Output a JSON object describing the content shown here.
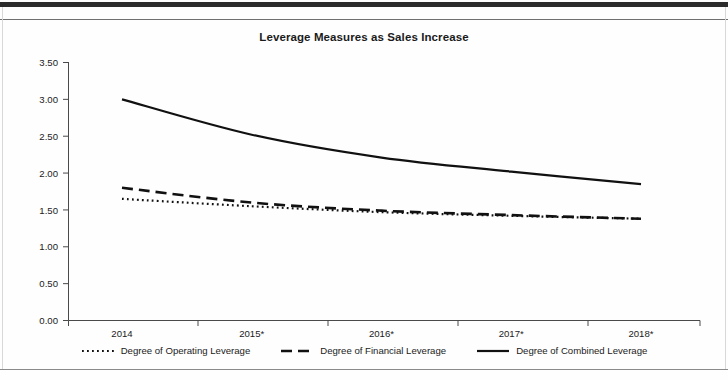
{
  "chart_data": {
    "type": "line",
    "title": "Leverage Measures as Sales Increase",
    "xlabel": "",
    "ylabel": "",
    "grid": false,
    "legend_position": "bottom",
    "categories": [
      "2014",
      "2015*",
      "2016*",
      "2017*",
      "2018*"
    ],
    "x_tick_labels": [
      "2014",
      "2015*",
      "2016*",
      "2017*",
      "2018*"
    ],
    "y_tick_labels": [
      "0.00",
      "0.50",
      "1.00",
      "1.50",
      "2.00",
      "2.50",
      "3.00",
      "3.50"
    ],
    "ylim": [
      0.0,
      3.5
    ],
    "y_tick_step": 0.5,
    "series": [
      {
        "name": "Degree of Operating Leverage",
        "style": "dotted",
        "color": "#111111",
        "values": [
          1.65,
          1.55,
          1.47,
          1.42,
          1.38
        ]
      },
      {
        "name": "Degree of Financial Leverage",
        "style": "dashed",
        "color": "#111111",
        "values": [
          1.8,
          1.6,
          1.49,
          1.43,
          1.38
        ]
      },
      {
        "name": "Degree of Combined Leverage",
        "style": "solid",
        "color": "#111111",
        "values": [
          3.0,
          2.52,
          2.21,
          2.02,
          1.85
        ]
      }
    ]
  },
  "legend": {
    "items": [
      {
        "label": "Degree of Operating Leverage",
        "style": "dotted"
      },
      {
        "label": "Degree of Financial Leverage",
        "style": "dashed"
      },
      {
        "label": "Degree of Combined Leverage",
        "style": "solid"
      }
    ]
  },
  "axes": {
    "y_ticks": [
      "0.00",
      "0.50",
      "1.00",
      "1.50",
      "2.00",
      "2.50",
      "3.00",
      "3.50"
    ],
    "x_ticks": [
      "2014",
      "2015*",
      "2016*",
      "2017*",
      "2018*"
    ]
  }
}
